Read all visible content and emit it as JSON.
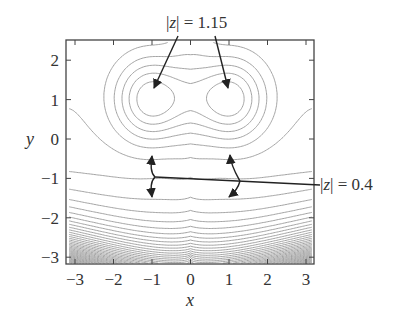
{
  "chart_data": {
    "type": "contour",
    "title": "",
    "xlabel": "x",
    "ylabel": "y",
    "xlim": [
      -3.2,
      3.2
    ],
    "ylim": [
      -3.2,
      2.6
    ],
    "xticks": [
      -3,
      -2,
      -1,
      0,
      1,
      2,
      3
    ],
    "yticks": [
      -3,
      -2,
      -1,
      0,
      1,
      2
    ],
    "xtick_labels": [
      "−3",
      "−2",
      "−1",
      "0",
      "1",
      "2",
      "3"
    ],
    "ytick_labels": [
      "−3",
      "−2",
      "−1",
      "0",
      "1",
      "2"
    ],
    "grid": false,
    "contour_color": "#9a9a9a",
    "annotation_color": "#222222",
    "critical_points": [
      {
        "x": -1,
        "y": 1,
        "kind": "extremum",
        "value": 1.15
      },
      {
        "x": 1,
        "y": 1,
        "kind": "extremum",
        "value": 1.15
      },
      {
        "x": -1,
        "y": -1,
        "kind": "saddle",
        "value": 0.4
      },
      {
        "x": 1,
        "y": -1,
        "kind": "saddle",
        "value": 0.4
      }
    ],
    "annotations": [
      {
        "text_prefix": "|",
        "var": "z",
        "text_suffix": "| = 1.15",
        "points_to": [
          [
            -1,
            1
          ],
          [
            1,
            1
          ]
        ],
        "position": "top"
      },
      {
        "text_prefix": "|",
        "var": "z",
        "text_suffix": "| = 0.4",
        "points_to": [
          [
            -1,
            -1
          ],
          [
            1,
            -1
          ]
        ],
        "position": "right"
      }
    ],
    "cusp": {
      "x": 0,
      "y": -3
    }
  },
  "labels": {
    "x_axis": "x",
    "y_axis": "y",
    "annot_top_prefix": "|",
    "annot_top_var": "z",
    "annot_top_suffix": "| = 1.15",
    "annot_right_prefix": "|",
    "annot_right_var": "z",
    "annot_right_suffix": "| = 0.4"
  }
}
